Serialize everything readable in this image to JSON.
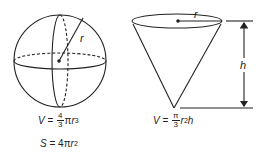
{
  "sphere": {
    "radius_label": "r",
    "volume": {
      "lhs": "V",
      "eq": " = ",
      "num": "4",
      "den": "3",
      "pi": "π",
      "var": "r",
      "exp": "3"
    },
    "surface": {
      "lhs": "S",
      "eq": " = 4",
      "pi": "π",
      "var": "r",
      "exp": "2"
    }
  },
  "cone": {
    "radius_label": "r",
    "height_label": "h",
    "volume": {
      "lhs": "V",
      "eq": " = ",
      "num": "π",
      "den": "3",
      "var": "r",
      "exp": "2",
      "var2": "h"
    }
  },
  "colors": {
    "stroke": "#222222",
    "background": "#ffffff"
  }
}
